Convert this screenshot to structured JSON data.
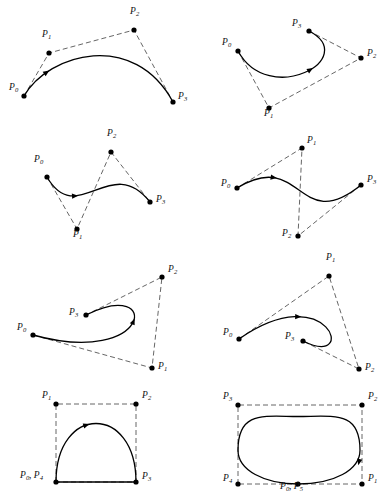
{
  "figure": {
    "style": {
      "curve_color": "#000000",
      "polygon_color": "#555555",
      "point_color": "#000000",
      "background": "#ffffff",
      "polygon_dash": "5,3"
    },
    "panels": [
      {
        "id": "panel-1",
        "name": "bezier-panel-arch",
        "curve_type": "cubic-bezier",
        "description": "simple arch, control polygon above curve",
        "control_points": [
          {
            "label": "P",
            "sub": "0",
            "x": 24,
            "y": 96,
            "label_dx": -15,
            "label_dy": -4
          },
          {
            "label": "P",
            "sub": "1",
            "x": 49,
            "y": 53,
            "label_dx": -7,
            "label_dy": -14
          },
          {
            "label": "P",
            "sub": "2",
            "x": 134,
            "y": 30,
            "label_dx": -4,
            "label_dy": -14
          },
          {
            "label": "P",
            "sub": "3",
            "x": 173,
            "y": 102,
            "label_dx": 5,
            "label_dy": -1
          }
        ],
        "arrow_t": 0.21
      },
      {
        "id": "panel-2",
        "name": "bezier-panel-c-loop",
        "curve_type": "cubic-bezier",
        "description": "C-shaped curve, crossing control polygon",
        "control_points": [
          {
            "label": "P",
            "sub": "0",
            "x": 238,
            "y": 51,
            "label_dx": -16,
            "label_dy": -4
          },
          {
            "label": "P",
            "sub": "1",
            "x": 269,
            "y": 108,
            "label_dx": -5,
            "label_dy": 10
          },
          {
            "label": "P",
            "sub": "2",
            "x": 361,
            "y": 58,
            "label_dx": 6,
            "label_dy": 0
          },
          {
            "label": "P",
            "sub": "3",
            "x": 309,
            "y": 31,
            "label_dx": -17,
            "label_dy": -3
          }
        ],
        "arrow_t": 0.55
      },
      {
        "id": "panel-3",
        "name": "bezier-panel-s-curve-left",
        "curve_type": "cubic-bezier",
        "description": "S-shaped curve with zig-zag control polygon",
        "control_points": [
          {
            "label": "P",
            "sub": "0",
            "x": 47,
            "y": 177,
            "label_dx": -13,
            "label_dy": -13
          },
          {
            "label": "P",
            "sub": "1",
            "x": 77,
            "y": 229,
            "label_dx": -4,
            "label_dy": 10
          },
          {
            "label": "P",
            "sub": "2",
            "x": 111,
            "y": 152,
            "label_dx": -4,
            "label_dy": -14
          },
          {
            "label": "P",
            "sub": "3",
            "x": 150,
            "y": 202,
            "label_dx": 6,
            "label_dy": 2
          }
        ],
        "arrow_t": 0.3
      },
      {
        "id": "panel-4",
        "name": "bezier-panel-s-curve-right",
        "curve_type": "cubic-bezier",
        "description": "shallow S-curve, control points above and below",
        "control_points": [
          {
            "label": "P",
            "sub": "0",
            "x": 237,
            "y": 188,
            "label_dx": -16,
            "label_dy": 0
          },
          {
            "label": "P",
            "sub": "1",
            "x": 302,
            "y": 148,
            "label_dx": 5,
            "label_dy": -3
          },
          {
            "label": "P",
            "sub": "2",
            "x": 298,
            "y": 236,
            "label_dx": -16,
            "label_dy": 2
          },
          {
            "label": "P",
            "sub": "3",
            "x": 361,
            "y": 185,
            "label_dx": 6,
            "label_dy": -1
          }
        ],
        "arrow_t": 0.24
      },
      {
        "id": "panel-5",
        "name": "bezier-panel-hook-left",
        "curve_type": "cubic-bezier",
        "description": "hook / cusp-like curve ending inside the polygon",
        "control_points": [
          {
            "label": "P",
            "sub": "0",
            "x": 33,
            "y": 335,
            "label_dx": -16,
            "label_dy": -3
          },
          {
            "label": "P",
            "sub": "1",
            "x": 152,
            "y": 368,
            "label_dx": 6,
            "label_dy": 3
          },
          {
            "label": "P",
            "sub": "2",
            "x": 162,
            "y": 277,
            "label_dx": 6,
            "label_dy": -3
          },
          {
            "label": "P",
            "sub": "3",
            "x": 86,
            "y": 315,
            "label_dx": -17,
            "label_dy": 2
          }
        ],
        "arrow_t": 0.52
      },
      {
        "id": "panel-6",
        "name": "bezier-panel-hook-right",
        "curve_type": "cubic-bezier",
        "description": "hook curve with loop turning back to interior endpoint",
        "control_points": [
          {
            "label": "P",
            "sub": "0",
            "x": 239,
            "y": 339,
            "label_dx": -16,
            "label_dy": -2
          },
          {
            "label": "P",
            "sub": "1",
            "x": 329,
            "y": 276,
            "label_dx": -3,
            "label_dy": -14
          },
          {
            "label": "P",
            "sub": "2",
            "x": 359,
            "y": 369,
            "label_dx": 6,
            "label_dy": 3
          },
          {
            "label": "P",
            "sub": "3",
            "x": 303,
            "y": 341,
            "label_dx": -18,
            "label_dy": 0
          }
        ],
        "arrow_t": 0.27
      },
      {
        "id": "panel-7",
        "name": "bezier-panel-teardrop",
        "curve_type": "closed-bezier-teardrop",
        "description": "closed teardrop loop, start and end coincide at lower-left",
        "control_points": [
          {
            "label": "P",
            "sub": "1",
            "x": 56,
            "y": 404,
            "label_dx": -14,
            "label_dy": -4
          },
          {
            "label": "P",
            "sub": "2",
            "x": 136,
            "y": 404,
            "label_dx": 6,
            "label_dy": -4
          },
          {
            "label": "P",
            "sub": "3",
            "x": 136,
            "y": 482,
            "label_dx": 6,
            "label_dy": -1
          },
          {
            "label": "P",
            "sub": "0, 4",
            "x": 56,
            "y": 482,
            "label_dx": -36,
            "label_dy": -2
          }
        ],
        "arrow_t": 0.42
      },
      {
        "id": "panel-8",
        "name": "bezier-panel-closed-oval",
        "curve_type": "closed-bezier-oval",
        "description": "closed oval loop, start and end coincide at bottom centre",
        "control_points": [
          {
            "label": "P",
            "sub": "3",
            "x": 238,
            "y": 405,
            "label_dx": -15,
            "label_dy": -4
          },
          {
            "label": "P",
            "sub": "2",
            "x": 362,
            "y": 405,
            "label_dx": 6,
            "label_dy": -4
          },
          {
            "label": "P",
            "sub": "1",
            "x": 362,
            "y": 484,
            "label_dx": 6,
            "label_dy": -1
          },
          {
            "label": "P",
            "sub": "4",
            "x": 238,
            "y": 484,
            "label_dx": -15,
            "label_dy": -1
          },
          {
            "label": "P",
            "sub": "0, 5",
            "x": 298,
            "y": 484,
            "label_dx": -18,
            "label_dy": 7
          }
        ],
        "arrow_t": 0.73
      }
    ],
    "labels": [
      {
        "id": "p0",
        "text": "P",
        "sub": "0"
      },
      {
        "id": "p1",
        "text": "P",
        "sub": "1"
      },
      {
        "id": "p2",
        "text": "P",
        "sub": "2"
      },
      {
        "id": "p3",
        "text": "P",
        "sub": "3"
      },
      {
        "id": "p4",
        "text": "P",
        "sub": "4"
      },
      {
        "id": "p5",
        "text": "P",
        "sub": "5"
      },
      {
        "id": "p0p4",
        "text": "P",
        "sub": "0, 4"
      },
      {
        "id": "p0p5",
        "text": "P",
        "sub": "0, 5"
      }
    ]
  }
}
